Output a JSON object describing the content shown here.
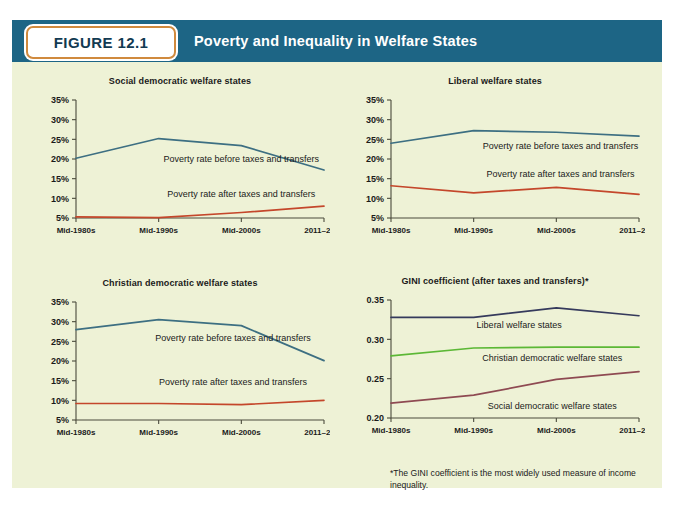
{
  "figure": {
    "badge": "FIGURE 12.1",
    "title": "Poverty and Inequality in Welfare States",
    "header_color": "#1d6585",
    "badge_border_color": "#d08a3e",
    "background_color": "#eef2d6"
  },
  "footnote": "*The GINI coefficient is the most widely used measure of income inequality.",
  "colors": {
    "before_taxes_line": "#3d6f82",
    "after_taxes_line": "#c4472b",
    "liberal_gini_line": "#353a5c",
    "christian_gini_line": "#5cb836",
    "social_gini_line": "#8e4a52"
  },
  "chart_data": [
    {
      "type": "line",
      "title": "Social democratic welfare states",
      "xlabel": "",
      "ylabel": "",
      "categories": [
        "Mid-1980s",
        "Mid-1990s",
        "Mid-2000s",
        "2011–2013"
      ],
      "yticks": [
        "5%",
        "10%",
        "15%",
        "20%",
        "25%",
        "30%",
        "35%"
      ],
      "ylim": [
        5,
        35
      ],
      "grid": false,
      "legend": "inline-annotations",
      "series": [
        {
          "name": "Poverty rate before taxes and transfers",
          "color": "#3d6f82",
          "values": [
            20.2,
            25.2,
            23.4,
            17.2
          ]
        },
        {
          "name": "Poverty rate after taxes and transfers",
          "color": "#c4472b",
          "values": [
            5.3,
            5.1,
            6.4,
            8.0
          ]
        }
      ],
      "annotations": [
        {
          "text": "Poverty rate before taxes and transfers",
          "x": 2.0,
          "y": 19.2
        },
        {
          "text": "Poverty rate after taxes and transfers",
          "x": 2.0,
          "y": 10.4
        }
      ]
    },
    {
      "type": "line",
      "title": "Liberal welfare states",
      "xlabel": "",
      "ylabel": "",
      "categories": [
        "Mid-1980s",
        "Mid-1990s",
        "Mid-2000s",
        "2011–2013"
      ],
      "yticks": [
        "5%",
        "10%",
        "15%",
        "20%",
        "25%",
        "30%",
        "35%"
      ],
      "ylim": [
        5,
        35
      ],
      "grid": false,
      "legend": "inline-annotations",
      "series": [
        {
          "name": "Poverty rate before taxes and transfers",
          "color": "#3d6f82",
          "values": [
            24.0,
            27.2,
            26.8,
            25.8
          ]
        },
        {
          "name": "Poverty rate after taxes and transfers",
          "color": "#c4472b",
          "values": [
            13.2,
            11.4,
            12.8,
            11.0
          ]
        }
      ],
      "annotations": [
        {
          "text": "Poverty rate before taxes and transfers",
          "x": 2.05,
          "y": 22.6
        },
        {
          "text": "Poverty rate after taxes and transfers",
          "x": 2.05,
          "y": 15.3
        }
      ]
    },
    {
      "type": "line",
      "title": "Christian democratic welfare states",
      "xlabel": "",
      "ylabel": "",
      "categories": [
        "Mid-1980s",
        "Mid-1990s",
        "Mid-2000s",
        "2011–2013"
      ],
      "yticks": [
        "5%",
        "10%",
        "15%",
        "20%",
        "25%",
        "30%",
        "35%"
      ],
      "ylim": [
        5,
        35
      ],
      "grid": false,
      "legend": "inline-annotations",
      "series": [
        {
          "name": "Poverty rate before taxes and transfers",
          "color": "#3d6f82",
          "values": [
            28.0,
            30.5,
            29.0,
            20.1
          ]
        },
        {
          "name": "Poverty rate after taxes and transfers",
          "color": "#c4472b",
          "values": [
            9.2,
            9.2,
            8.9,
            10.0
          ]
        }
      ],
      "annotations": [
        {
          "text": "Poverty rate before taxes and transfers",
          "x": 1.9,
          "y": 25.0
        },
        {
          "text": "Poverty rate after taxes and transfers",
          "x": 1.9,
          "y": 14.0
        }
      ]
    },
    {
      "type": "line",
      "title": "GINI coefficient (after taxes and transfers)*",
      "xlabel": "",
      "ylabel": "",
      "categories": [
        "Mid-1980s",
        "Mid-1990s",
        "Mid-2000s",
        "2011–2013"
      ],
      "yticks": [
        "0.20",
        "0.25",
        "0.30",
        "0.35"
      ],
      "ylim": [
        0.2,
        0.35
      ],
      "grid": false,
      "legend": "inline-annotations",
      "series": [
        {
          "name": "Liberal welfare states",
          "color": "#353a5c",
          "values": [
            0.328,
            0.328,
            0.34,
            0.33
          ]
        },
        {
          "name": "Christian democratic welfare states",
          "color": "#5cb836",
          "values": [
            0.279,
            0.289,
            0.29,
            0.29
          ]
        },
        {
          "name": "Social democratic welfare states",
          "color": "#8e4a52",
          "values": [
            0.219,
            0.229,
            0.249,
            0.259
          ]
        }
      ],
      "annotations": [
        {
          "text": "Liberal welfare states",
          "x": 1.55,
          "y": 0.315
        },
        {
          "text": "Christian democratic welfare states",
          "x": 1.95,
          "y": 0.2725
        },
        {
          "text": "Social democratic welfare states",
          "x": 1.95,
          "y": 0.2115
        }
      ]
    }
  ]
}
